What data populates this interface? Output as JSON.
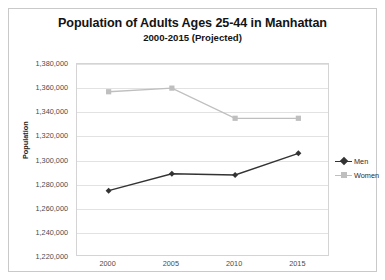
{
  "chart_data": {
    "type": "line",
    "title": "Population of Adults Ages 25-44 in Manhattan",
    "subtitle": "2000-2015 (Projected)",
    "xlabel": "",
    "ylabel": "Population",
    "categories": [
      "2000",
      "2005",
      "2010",
      "2015"
    ],
    "ylim": [
      1220000,
      1380000
    ],
    "ytick_step": 20000,
    "ytick_labels": [
      "1,380,000",
      "1,360,000",
      "1,340,000",
      "1,320,000",
      "1,300,000",
      "1,280,000",
      "1,260,000",
      "1,240,000",
      "1,220,000"
    ],
    "ytick_values": [
      1380000,
      1360000,
      1340000,
      1320000,
      1300000,
      1280000,
      1260000,
      1240000,
      1220000
    ],
    "grid": true,
    "legend_position": "right",
    "series": [
      {
        "name": "Men",
        "color": "#333333",
        "marker": "diamond",
        "values": [
          1275000,
          1289000,
          1288000,
          1306000
        ]
      },
      {
        "name": "Women",
        "color": "#bfbfbf",
        "marker": "square",
        "values": [
          1357000,
          1360000,
          1335000,
          1335000
        ]
      }
    ]
  },
  "legend": {
    "items": [
      {
        "label": "Men"
      },
      {
        "label": "Women"
      }
    ]
  },
  "colors": {
    "men": "#333333",
    "women": "#bfbfbf",
    "gridline": "#e2e2e2",
    "plot_border": "#d4d4d4",
    "frame_border": "#c9c9c9",
    "text": "#4b4b4b",
    "title_text": "#131313"
  }
}
